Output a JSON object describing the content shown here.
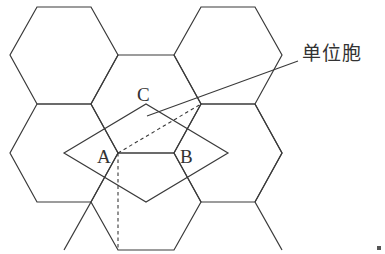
{
  "diagram": {
    "type": "hexagonal lattice with unit cell",
    "labels": {
      "point_a": "A",
      "point_b": "B",
      "point_c": "C",
      "unit_cell": "单位胞"
    },
    "line_color": "#3a3a3a"
  }
}
